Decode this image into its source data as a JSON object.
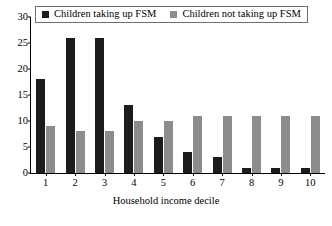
{
  "chart_data": {
    "type": "bar",
    "title": "",
    "xlabel": "Household income decile",
    "ylabel": "",
    "categories": [
      "1",
      "2",
      "3",
      "4",
      "5",
      "6",
      "7",
      "8",
      "9",
      "10"
    ],
    "series": [
      {
        "name": "Children taking up FSM",
        "color": "#1c1c1c",
        "values": [
          18,
          26,
          26,
          13,
          7,
          4,
          3,
          1,
          1,
          1
        ]
      },
      {
        "name": "Children not taking up FSM",
        "color": "#8c8c8c",
        "values": [
          9,
          8,
          8,
          10,
          10,
          11,
          11,
          11,
          11,
          11
        ]
      }
    ],
    "ylim": [
      0,
      30
    ],
    "yticks": [
      0,
      5,
      10,
      15,
      20,
      25,
      30
    ],
    "ytick_labels": [
      "0",
      "5",
      "10",
      "15",
      "20",
      "25",
      "30"
    ],
    "grid": false,
    "legend_position": "top-inside"
  },
  "legend": {
    "items": [
      {
        "label": "Children taking up FSM"
      },
      {
        "label": "Children not taking up FSM"
      }
    ]
  }
}
